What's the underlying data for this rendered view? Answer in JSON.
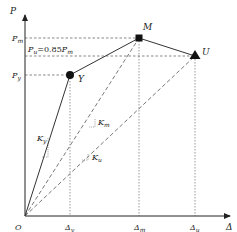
{
  "diagram": {
    "type": "load-displacement curve (trilinear skeleton)",
    "axes": {
      "y_label": "P",
      "x_label": "Δ",
      "origin_label": "O"
    },
    "y_ticks": [
      {
        "id": "Pm",
        "main": "P",
        "sub": "m"
      },
      {
        "id": "Pu",
        "main": "P",
        "sub": "u",
        "annotation": "P u=0.85P m",
        "ann_main1": "P",
        "ann_sub1": "u",
        "ann_mid": "=0.85",
        "ann_main2": "P",
        "ann_sub2": "m"
      },
      {
        "id": "Py",
        "main": "P",
        "sub": "y"
      }
    ],
    "x_ticks": [
      {
        "id": "Dy",
        "main": "Δ",
        "sub": "y"
      },
      {
        "id": "Dm",
        "main": "Δ",
        "sub": "m"
      },
      {
        "id": "Du",
        "main": "Δ",
        "sub": "u"
      }
    ],
    "points": [
      {
        "id": "Y",
        "label": "Y",
        "marker": "circle"
      },
      {
        "id": "M",
        "label": "M",
        "marker": "square"
      },
      {
        "id": "U",
        "label": "U",
        "marker": "triangle"
      }
    ],
    "stiffness_labels": [
      {
        "id": "Ky",
        "main": "K",
        "sub": "y"
      },
      {
        "id": "Km",
        "main": "K",
        "sub": "m"
      },
      {
        "id": "Ku",
        "main": "K",
        "sub": "u"
      }
    ],
    "colors": {
      "line": "#333333",
      "dashed": "#555555",
      "marker": "#111111"
    }
  }
}
